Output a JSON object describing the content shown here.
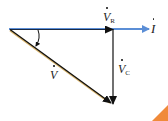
{
  "diagram": {
    "type": "phasor-diagram",
    "colors": {
      "current_arrow": "#5b8ed6",
      "voltage_arrows": "#111111",
      "hypotenuse_underlay": "#d9b46a",
      "corner_accent": "#f08a3a"
    },
    "labels": {
      "current": {
        "symbol": "I",
        "dot": true
      },
      "vr": {
        "symbol": "V",
        "sub": "R",
        "dot": true
      },
      "vc": {
        "symbol": "V",
        "sub": "C",
        "dot": true
      },
      "v": {
        "symbol": "V",
        "dot": true
      }
    },
    "angle_marker": "phase-angle-arc"
  }
}
